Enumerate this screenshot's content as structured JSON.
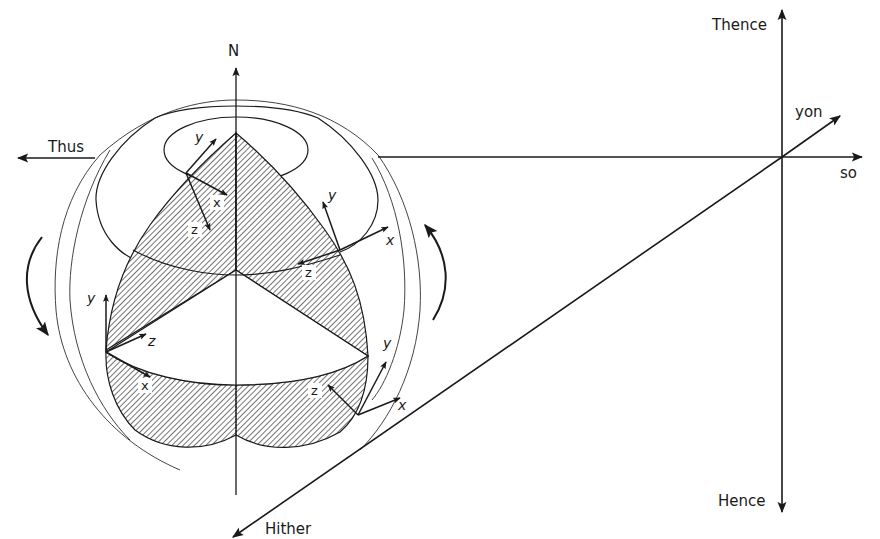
{
  "diagram": {
    "colors": {
      "ink": "#1a1a1a",
      "background": "#ffffff",
      "hatch": "#2a2a2a",
      "thin": "#444444"
    },
    "sphere_axis_label": "N",
    "world_axes": {
      "left": "Thus",
      "right": "so",
      "up": "Thence",
      "down": "Hence",
      "forward": "yon",
      "back": "Hither"
    },
    "local_frames": [
      {
        "id": "frame-top-left",
        "labels": {
          "y": "y",
          "x": "x",
          "z": "z"
        }
      },
      {
        "id": "frame-top-right",
        "labels": {
          "y": "y",
          "x": "x",
          "z": "z"
        }
      },
      {
        "id": "frame-middle-left",
        "labels": {
          "y": "y",
          "z": "z",
          "x": "x"
        }
      },
      {
        "id": "frame-bottom-right",
        "labels": {
          "y": "y",
          "z": "z",
          "x": "x"
        }
      }
    ],
    "rotation_arrows": [
      "left-rotation-arrow",
      "right-rotation-arrow"
    ]
  }
}
